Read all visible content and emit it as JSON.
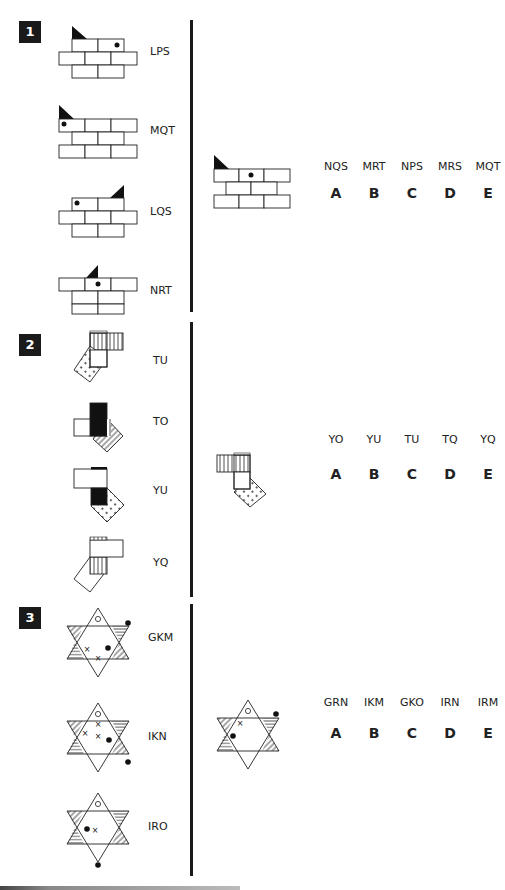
{
  "questions": [
    {
      "number": "1",
      "figures": [
        {
          "code": "LPS"
        },
        {
          "code": "MQT"
        },
        {
          "code": "LQS"
        },
        {
          "code": "NRT"
        }
      ],
      "options": {
        "codes": [
          "NQS",
          "MRT",
          "NPS",
          "MRS",
          "MQT"
        ],
        "letters": [
          "A",
          "B",
          "C",
          "D",
          "E"
        ]
      }
    },
    {
      "number": "2",
      "figures": [
        {
          "code": "TU"
        },
        {
          "code": "TO"
        },
        {
          "code": "YU"
        },
        {
          "code": "YQ"
        }
      ],
      "options": {
        "codes": [
          "YO",
          "YU",
          "TU",
          "TQ",
          "YQ"
        ],
        "letters": [
          "A",
          "B",
          "C",
          "D",
          "E"
        ]
      }
    },
    {
      "number": "3",
      "figures": [
        {
          "code": "GKM"
        },
        {
          "code": "IKN"
        },
        {
          "code": "IRO"
        }
      ],
      "options": {
        "codes": [
          "GRN",
          "IKM",
          "GKO",
          "IRN",
          "IRM"
        ],
        "letters": [
          "A",
          "B",
          "C",
          "D",
          "E"
        ]
      }
    }
  ],
  "icons": {
    "wall": "brick-wall-figure",
    "squares": "overlapping-squares-figure",
    "star": "six-point-star-figure"
  }
}
